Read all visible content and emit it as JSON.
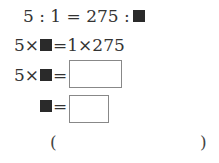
{
  "equations": [
    {
      "left": "5 : 1 = 275 :",
      "unknown": "■"
    },
    {
      "prefix": "5×",
      "mid": "=1×275"
    },
    {
      "prefix": "5×",
      "mid": "=",
      "answer_box": ""
    },
    {
      "mid": "=",
      "answer_box": ""
    }
  ],
  "answer": {
    "open": "(",
    "close": ")",
    "value": ""
  }
}
